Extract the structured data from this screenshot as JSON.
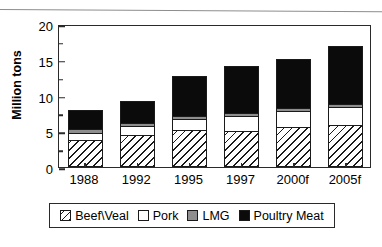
{
  "chart_data": {
    "type": "bar",
    "stacked": true,
    "title": "",
    "xlabel": "",
    "ylabel": "Million tons",
    "ylim": [
      0,
      20
    ],
    "ytick_values": [
      0,
      5,
      10,
      15,
      20
    ],
    "ytick_labels": [
      "0",
      "5",
      "10",
      "15",
      "20"
    ],
    "yminor_values": [
      2.5,
      7.5,
      12.5,
      17.5
    ],
    "grid": false,
    "legend_position": "bottom",
    "categories": [
      "1988",
      "1992",
      "1995",
      "1997",
      "2000f",
      "2005f"
    ],
    "series": [
      {
        "name": "Beef\\Veal",
        "swatch": "hatched",
        "color": "#ffffff",
        "values": [
          3.6,
          4.4,
          5.1,
          4.9,
          5.5,
          5.8
        ]
      },
      {
        "name": "Pork",
        "swatch": "white",
        "color": "#ffffff",
        "values": [
          1.0,
          1.2,
          1.5,
          2.1,
          2.2,
          2.5
        ]
      },
      {
        "name": "LMG",
        "swatch": "gray",
        "color": "#8e8e8e",
        "values": [
          0.6,
          0.4,
          0.4,
          0.4,
          0.4,
          0.4
        ]
      },
      {
        "name": "Poultry Meat",
        "swatch": "black",
        "color": "#0b0b0b",
        "values": [
          2.6,
          3.1,
          5.5,
          6.6,
          6.9,
          8.1
        ]
      }
    ],
    "totals": [
      7.8,
      9.1,
      12.5,
      14.0,
      15.0,
      16.8
    ]
  }
}
